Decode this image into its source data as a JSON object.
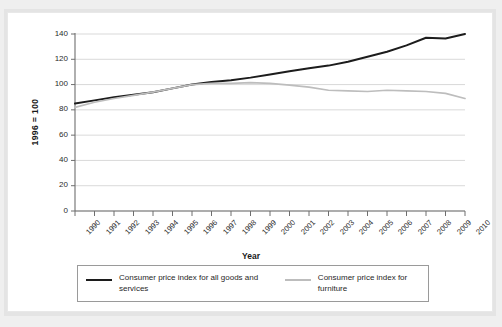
{
  "chart_data": {
    "type": "line",
    "title": "",
    "xlabel": "Year",
    "ylabel": "1996 = 100",
    "ylim": [
      0,
      140
    ],
    "yticks": [
      0,
      20,
      40,
      60,
      80,
      100,
      120,
      140
    ],
    "grid": true,
    "legend_position": "bottom",
    "x": [
      1990,
      1991,
      1992,
      1993,
      1994,
      1995,
      1996,
      1997,
      1998,
      1999,
      2000,
      2001,
      2002,
      2003,
      2004,
      2005,
      2006,
      2007,
      2008,
      2009,
      2010
    ],
    "categories": [
      "1990",
      "1991",
      "1992",
      "1993",
      "1994",
      "1995",
      "1996",
      "1997",
      "1998",
      "1999",
      "2000",
      "2001",
      "2002",
      "2003",
      "2004",
      "2005",
      "2006",
      "2007",
      "2008",
      "2009",
      "2010"
    ],
    "series": [
      {
        "name": "Consumer price index for all goods and services",
        "color": "#1c1c1c",
        "values": [
          85,
          87.5,
          90,
          92,
          94,
          97,
          100,
          102,
          103.5,
          105.5,
          108,
          110.5,
          113,
          115,
          118,
          122,
          126,
          131,
          137,
          136.5,
          140
        ]
      },
      {
        "name": "Consumer price index for furniture",
        "color": "#bdbdbd",
        "values": [
          82,
          86,
          89,
          91.5,
          94,
          97,
          100,
          101,
          101,
          101.5,
          101,
          99.5,
          98,
          95.5,
          95,
          94.5,
          95.5,
          95,
          94.5,
          93,
          89
        ]
      }
    ]
  },
  "axis": {
    "y_title": "1996 = 100",
    "x_title": "Year",
    "y_tick_labels": [
      "140",
      "120",
      "100",
      "80",
      "60",
      "40",
      "20",
      "0"
    ],
    "x_tick_labels": [
      "1990",
      "1991",
      "1992",
      "1993",
      "1994",
      "1995",
      "1996",
      "1997",
      "1998",
      "1999",
      "2000",
      "2001",
      "2002",
      "2003",
      "2004",
      "2005",
      "2006",
      "2007",
      "2008",
      "2009",
      "2010"
    ]
  },
  "legend": {
    "entries": [
      {
        "label": "Consumer price index for all goods and services",
        "color": "#1c1c1c",
        "style": "dark"
      },
      {
        "label": "Consumer price index for furniture",
        "color": "#bdbdbd",
        "style": "gray"
      }
    ]
  },
  "colors": {
    "series_all_goods": "#1c1c1c",
    "series_furniture": "#bdbdbd",
    "grid": "#cfcfcf",
    "axis": "#6e6e6e",
    "card_background": "#ffffff",
    "page_background": "#efefef"
  }
}
